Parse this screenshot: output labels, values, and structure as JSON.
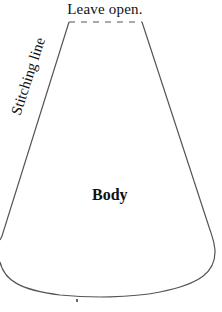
{
  "diagram": {
    "labels": {
      "top": "Leave open.",
      "side": "Stitching line",
      "center": "Body"
    },
    "colors": {
      "stroke": "#555555",
      "text": "#111111",
      "background": "#ffffff"
    },
    "shape": {
      "open_edge": {
        "x1": 69,
        "y1": 22,
        "x2": 142,
        "y2": 22,
        "style": "dashed"
      },
      "stitched_edges": "solid"
    }
  }
}
